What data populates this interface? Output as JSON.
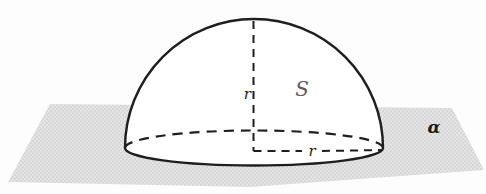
{
  "figure": {
    "labels": {
      "apex_radius": "r",
      "base_radius": "r",
      "surface": "S",
      "plane": "α"
    },
    "colors": {
      "background": "#fdfdfd",
      "line": "#1e1e1e",
      "plane-fill": "#e4e4e4",
      "plane-dot": "#c8c8c8",
      "dome-fill": "#ffffff",
      "surface-label": "#5c5c5c",
      "label": "#1a1a1a"
    }
  }
}
